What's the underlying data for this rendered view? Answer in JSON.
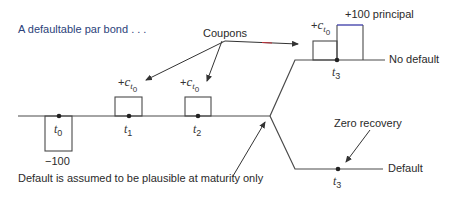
{
  "title": "A defaultable par bond . . .",
  "callouts": {
    "coupons": "Coupons",
    "zero_recovery": "Zero recovery",
    "default_note": "Default is assumed to be plausible at maturity only"
  },
  "timeline": {
    "ticks": [
      {
        "name": "t",
        "sub": "0",
        "x": 59
      },
      {
        "name": "t",
        "sub": "1",
        "x": 129
      },
      {
        "name": "t",
        "sub": "2",
        "x": 198
      }
    ],
    "initial_payment": "−100",
    "coupon_label": {
      "sign": "+",
      "var": "c",
      "sub_var": "t",
      "sub_sub": "0"
    }
  },
  "branches": {
    "no_default": {
      "label": "No default",
      "tick": {
        "name": "t",
        "sub": "3"
      },
      "coupon_label": {
        "sign": "+",
        "var": "c",
        "sub_var": "t",
        "sub_sub": "0"
      },
      "principal_label": "+100 principal"
    },
    "default": {
      "label": "Default",
      "tick": {
        "name": "t",
        "sub": "3"
      }
    }
  },
  "colors": {
    "line": "#4a4a4a",
    "title": "#2b3f7a",
    "principal_top": "#3a3aa8",
    "arrow_accent": "#c0303a"
  }
}
